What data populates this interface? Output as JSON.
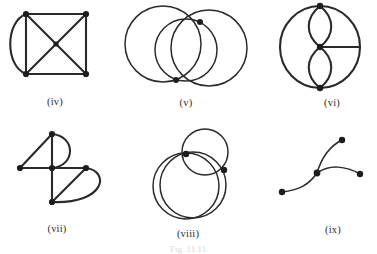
{
  "sheet": {
    "caption": "Fig. 11.11",
    "background_color": "#ffffff",
    "ink_color": "#2a2a2a",
    "vertex_color": "#1d1d1d"
  },
  "figures": [
    {
      "id": "iv",
      "label": "(iv)",
      "description": "Square with both diagonals drawn plus a curved arc joining the two left-hand corners",
      "vertices": 4,
      "edges": 7,
      "shapes": [
        "square",
        "diagonal",
        "diagonal",
        "left-arc"
      ]
    },
    {
      "id": "v",
      "label": "(v)",
      "description": "Three overlapping circles; two marked intersection vertices top-right and bottom-centre",
      "vertices": 2,
      "edges": 4,
      "shapes": [
        "circle",
        "circle",
        "circle"
      ]
    },
    {
      "id": "vi",
      "label": "(vi)",
      "description": "Large circle with top, centre and bottom vertices, two lens shapes stacked between them, and a horizontal spoke from the centre to the right rim",
      "vertices": 3,
      "edges": 7,
      "shapes": [
        "circle",
        "lens",
        "lens",
        "spoke"
      ]
    },
    {
      "id": "vii",
      "label": "(vii)",
      "description": "Five vertices: top, left, centre, right, bottom joined by straight edges with two semicircular arcs on the right",
      "vertices": 5,
      "edges": 7,
      "shapes": [
        "triangle",
        "cross",
        "arc",
        "arc"
      ]
    },
    {
      "id": "viii",
      "label": "(viii)",
      "description": "Two large offset overlapping circles with a smaller circle at the upper right; two marked vertices",
      "vertices": 2,
      "edges": 3,
      "shapes": [
        "circle",
        "circle",
        "small-circle"
      ]
    },
    {
      "id": "ix",
      "label": "(ix)",
      "description": "Open S-shaped curve through four vertices, no closed loop",
      "vertices": 4,
      "edges": 3,
      "shapes": [
        "curve",
        "curve",
        "curve"
      ]
    }
  ]
}
